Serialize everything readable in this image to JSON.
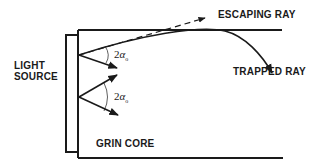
{
  "diagram": {
    "type": "optical-schematic",
    "labels": {
      "escaping_ray": "ESCAPING RAY",
      "trapped_ray": "TRAPPED RAY",
      "light_source_line1": "LIGHT",
      "light_source_line2": "SOURCE",
      "grin_core": "GRIN CORE"
    },
    "angles": [
      {
        "coef": "2",
        "symbol": "α",
        "sub": "o"
      },
      {
        "coef": "2",
        "symbol": "α",
        "sub": "o"
      }
    ],
    "colors": {
      "ink": "#1a1a1a",
      "background": "#ffffff"
    }
  }
}
